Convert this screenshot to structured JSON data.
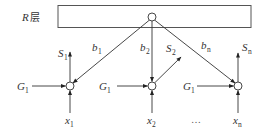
{
  "diagram": {
    "layer_label": {
      "main": "R",
      "suffix": "层"
    },
    "layer_box": {
      "x": 58,
      "y": 5,
      "width": 193,
      "height": 23
    },
    "top_node": {
      "x": 152,
      "y": 17
    },
    "nodes": [
      {
        "id": "node-1",
        "x": 70,
        "y": 86,
        "weight": {
          "main": "b",
          "sub": "1"
        },
        "output": {
          "main": "S",
          "sub": "1"
        },
        "gain": {
          "main": "G",
          "sub": "1"
        },
        "input": {
          "main": "x",
          "sub": "1"
        }
      },
      {
        "id": "node-2",
        "x": 152,
        "y": 86,
        "weight": {
          "main": "b",
          "sub": "2"
        },
        "output": {
          "main": "S",
          "sub": "2"
        },
        "gain": {
          "main": "G",
          "sub": "1"
        },
        "input": {
          "main": "x",
          "sub": "2"
        }
      },
      {
        "id": "node-n",
        "x": 238,
        "y": 86,
        "weight": {
          "main": "b",
          "sub": "n"
        },
        "output": {
          "main": "S",
          "sub": "n"
        },
        "gain": {
          "main": "G",
          "sub": "1"
        },
        "input": {
          "main": "x",
          "sub": "n"
        }
      }
    ],
    "ellipsis": "…",
    "colors": {
      "stroke": "#333333",
      "background": "#ffffff"
    }
  }
}
